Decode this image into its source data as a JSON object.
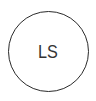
{
  "avatar": {
    "initials": "LS",
    "border_color": "#2a2a2a",
    "text_color": "#333333",
    "background": "#ffffff"
  }
}
